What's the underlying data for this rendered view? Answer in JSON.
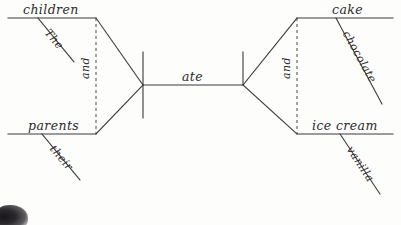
{
  "document": {
    "type": "reed-kellogg-sentence-diagram",
    "sentence": "The children and their parents ate chocolate cake and vanilla ice cream",
    "background_color": "#fdfdfc",
    "ink_color": "#2b2b2b"
  },
  "subject": {
    "conjunction": "and",
    "parts": [
      {
        "word": "children",
        "modifier": "The"
      },
      {
        "word": "parents",
        "modifier": "their"
      }
    ]
  },
  "predicate": {
    "verb": "ate"
  },
  "object": {
    "conjunction": "and",
    "parts": [
      {
        "word": "cake",
        "modifier": "chocolate"
      },
      {
        "word": "ice cream",
        "modifier": "vanilla"
      }
    ]
  },
  "labels": {
    "subject_upper": "children",
    "subject_upper_modifier": "The",
    "subject_lower": "parents",
    "subject_lower_modifier": "their",
    "subject_conjunction": "and",
    "verb": "ate",
    "object_upper": "cake",
    "object_upper_modifier": "chocolate",
    "object_lower": "ice cream",
    "object_lower_modifier": "vanilla",
    "object_conjunction": "and"
  }
}
